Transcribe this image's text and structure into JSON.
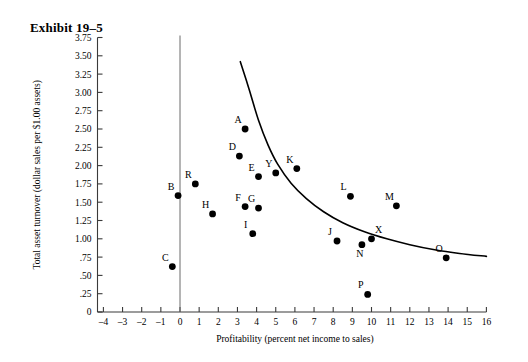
{
  "exhibit": {
    "title": "Exhibit 19–5"
  },
  "chart_data": {
    "type": "scatter",
    "title": "Exhibit 19–5",
    "xlabel": "Profitability (percent net income to sales)",
    "ylabel": "Total asset turnover (dollar sales per $1.00 assets)",
    "xlim": [
      -4,
      16
    ],
    "ylim": [
      0,
      3.75
    ],
    "grid": false,
    "legend": null,
    "xticks": [
      -4,
      -3,
      -2,
      -1,
      0,
      1,
      2,
      3,
      4,
      5,
      6,
      7,
      8,
      9,
      10,
      11,
      12,
      13,
      14,
      15,
      16
    ],
    "xtick_labels": [
      "–4",
      "–3",
      "–2",
      "–1",
      "0",
      "1",
      "2",
      "3",
      "4",
      "5",
      "6",
      "7",
      "8",
      "9",
      "10",
      "11",
      "12",
      "13",
      "14",
      "15",
      "16"
    ],
    "yticks": [
      0,
      0.25,
      0.5,
      0.75,
      1.0,
      1.25,
      1.5,
      1.75,
      2.0,
      2.25,
      2.5,
      2.75,
      3.0,
      3.25,
      3.5,
      3.75
    ],
    "ytick_labels": [
      "0",
      ".25",
      ".50",
      ".75",
      "1.00",
      "1.25",
      "1.50",
      "1.75",
      "2.00",
      "2.25",
      "2.50",
      "2.75",
      "3.00",
      "3.25",
      "3.50",
      "3.75"
    ],
    "vertical_reference_line_x": 0,
    "points": [
      {
        "label": "A",
        "x": 3.4,
        "y": 2.5,
        "label_pos": "up-left"
      },
      {
        "label": "B",
        "x": -0.1,
        "y": 1.59,
        "label_pos": "up-left"
      },
      {
        "label": "C",
        "x": -0.4,
        "y": 0.62,
        "label_pos": "up-left"
      },
      {
        "label": "D",
        "x": 3.1,
        "y": 2.13,
        "label_pos": "up-left"
      },
      {
        "label": "E",
        "x": 4.1,
        "y": 1.85,
        "label_pos": "up-left"
      },
      {
        "label": "F",
        "x": 3.4,
        "y": 1.44,
        "label_pos": "up-left"
      },
      {
        "label": "G",
        "x": 4.1,
        "y": 1.42,
        "label_pos": "up-left"
      },
      {
        "label": "H",
        "x": 1.7,
        "y": 1.34,
        "label_pos": "up-left"
      },
      {
        "label": "I",
        "x": 3.8,
        "y": 1.07,
        "label_pos": "up-left"
      },
      {
        "label": "J",
        "x": 8.2,
        "y": 0.97,
        "label_pos": "up-left"
      },
      {
        "label": "K",
        "x": 6.1,
        "y": 1.96,
        "label_pos": "up-left"
      },
      {
        "label": "L",
        "x": 8.9,
        "y": 1.58,
        "label_pos": "up-left"
      },
      {
        "label": "M",
        "x": 11.3,
        "y": 1.45,
        "label_pos": "up-left"
      },
      {
        "label": "N",
        "x": 9.5,
        "y": 0.92,
        "label_pos": "down-left"
      },
      {
        "label": "O",
        "x": 13.9,
        "y": 0.74,
        "label_pos": "up-left"
      },
      {
        "label": "P",
        "x": 9.8,
        "y": 0.24,
        "label_pos": "up-left"
      },
      {
        "label": "R",
        "x": 0.8,
        "y": 1.75,
        "label_pos": "up-left"
      },
      {
        "label": "X",
        "x": 10.0,
        "y": 1.0,
        "label_pos": "up-right"
      },
      {
        "label": "Y",
        "x": 5.0,
        "y": 1.9,
        "label_pos": "up-left"
      }
    ],
    "trend_curve": {
      "description": "decreasing hyperbolic fit line",
      "points": [
        {
          "x": 3.15,
          "y": 3.42
        },
        {
          "x": 3.6,
          "y": 3.05
        },
        {
          "x": 4.1,
          "y": 2.62
        },
        {
          "x": 4.6,
          "y": 2.28
        },
        {
          "x": 5.1,
          "y": 2.02
        },
        {
          "x": 5.8,
          "y": 1.76
        },
        {
          "x": 6.6,
          "y": 1.55
        },
        {
          "x": 7.5,
          "y": 1.37
        },
        {
          "x": 8.5,
          "y": 1.22
        },
        {
          "x": 9.6,
          "y": 1.1
        },
        {
          "x": 10.8,
          "y": 1.0
        },
        {
          "x": 12.0,
          "y": 0.92
        },
        {
          "x": 13.3,
          "y": 0.85
        },
        {
          "x": 14.6,
          "y": 0.8
        },
        {
          "x": 16.0,
          "y": 0.76
        }
      ]
    }
  }
}
